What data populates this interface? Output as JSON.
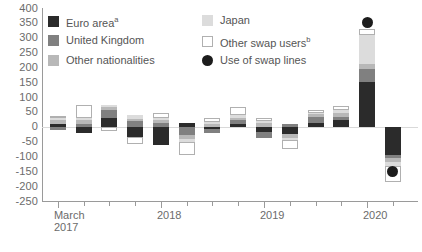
{
  "chart_data": {
    "type": "bar",
    "stacked": true,
    "title": "",
    "xlabel": "",
    "ylabel": "",
    "ylim": [
      -250,
      400
    ],
    "ytick_step": 50,
    "yticks": [
      400,
      350,
      300,
      250,
      200,
      150,
      100,
      50,
      0,
      -50,
      -100,
      -150,
      -200,
      -250
    ],
    "ytick_labels": [
      "400",
      "350",
      "300",
      "250",
      "200",
      "150",
      "100",
      "50",
      "0",
      "-50",
      "-100",
      "-150",
      "-200",
      "-250"
    ],
    "grid": false,
    "zero_line": true,
    "x_major_labels": [
      "March\n2017",
      "2018",
      "2019",
      "2020"
    ],
    "x_major_indices": [
      0,
      4,
      8,
      12
    ],
    "categories": [
      "2017Q1",
      "2017Q2",
      "2017Q3",
      "2017Q4",
      "2018Q1",
      "2018Q2",
      "2018Q3",
      "2018Q4",
      "2019Q1",
      "2019Q2",
      "2019Q3",
      "2019Q4",
      "2020Q1",
      "2020Q2"
    ],
    "series": [
      {
        "name": "Euro area",
        "name_sup": "a",
        "color": "#2b2b2b",
        "values": [
          10,
          -22,
          30,
          -34,
          -62,
          14,
          -8,
          8,
          -18,
          -26,
          14,
          22,
          150,
          -95
        ]
      },
      {
        "name": "United Kingdom",
        "name_sup": "",
        "color": "#808080",
        "values": [
          -12,
          10,
          26,
          20,
          14,
          -28,
          -12,
          16,
          -20,
          10,
          20,
          12,
          45,
          -10
        ]
      },
      {
        "name": "Other nationalities",
        "name_sup": "",
        "color": "#b8b8b8",
        "values": [
          12,
          12,
          10,
          6,
          10,
          -14,
          10,
          6,
          14,
          -12,
          8,
          14,
          18,
          -12
        ]
      },
      {
        "name": "Japan",
        "name_sup": "",
        "color": "#dcdcdc",
        "values": [
          6,
          8,
          8,
          12,
          6,
          -10,
          6,
          10,
          6,
          -8,
          6,
          10,
          95,
          -14
        ]
      },
      {
        "name": "Other swap users",
        "name_sup": "b",
        "color": "#ffffff",
        "values": [
          8,
          42,
          -14,
          -24,
          18,
          -42,
          12,
          26,
          10,
          -30,
          10,
          12,
          22,
          -55
        ]
      }
    ],
    "overlay": {
      "name": "Use of swap lines",
      "marker": "filled-circle",
      "color": "#1c1c1c",
      "points": [
        {
          "index": 12,
          "value": 350
        },
        {
          "index": 13,
          "value": -150
        }
      ]
    },
    "legend": {
      "position": "top-left",
      "entries": [
        {
          "label": "Euro area",
          "sup": "a",
          "swatch": "#2b2b2b",
          "shape": "square"
        },
        {
          "label": "United Kingdom",
          "sup": "",
          "swatch": "#808080",
          "shape": "square"
        },
        {
          "label": "Other nationalities",
          "sup": "",
          "swatch": "#b8b8b8",
          "shape": "square"
        },
        {
          "label": "Japan",
          "sup": "",
          "swatch": "#dcdcdc",
          "shape": "square"
        },
        {
          "label": "Other swap users",
          "sup": "b",
          "swatch": "#ffffff",
          "shape": "square-outline"
        },
        {
          "label": "Use of swap lines",
          "sup": "",
          "swatch": "#1c1c1c",
          "shape": "circle"
        }
      ]
    },
    "colors": {
      "axis": "#9a9a9a",
      "zero_line": "#d9d9d9",
      "text": "#6b6b6b",
      "background": "#ffffff",
      "bar_outline": "#b0b0b0"
    }
  }
}
